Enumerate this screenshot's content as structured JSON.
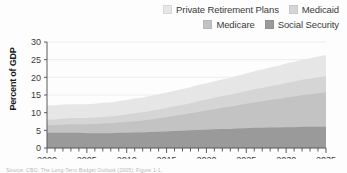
{
  "chart_data": {
    "type": "area",
    "stacked": true,
    "title": "",
    "subtitle": "",
    "xlabel": "",
    "ylabel": "Percent of GDP",
    "xlim": [
      2000,
      2035
    ],
    "ylim": [
      0,
      30
    ],
    "yticks": [
      0,
      5,
      10,
      15,
      20,
      25,
      30
    ],
    "xticks": [
      2000,
      2005,
      2010,
      2015,
      2020,
      2025,
      2030,
      2035
    ],
    "xtick_labels": [
      "2000",
      "2005",
      "2010",
      "2015",
      "2020",
      "2025",
      "2030",
      "2035"
    ],
    "ytick_labels": [
      "0",
      "5",
      "10",
      "15",
      "20",
      "25",
      "30"
    ],
    "x_minor_tick_interval": 1,
    "grid": true,
    "grid_axis": "y",
    "legend_position": "top-right",
    "x": [
      2000,
      2001,
      2002,
      2003,
      2004,
      2005,
      2006,
      2007,
      2008,
      2009,
      2010,
      2011,
      2012,
      2013,
      2014,
      2015,
      2016,
      2017,
      2018,
      2019,
      2020,
      2021,
      2022,
      2023,
      2024,
      2025,
      2026,
      2027,
      2028,
      2029,
      2030,
      2031,
      2032,
      2033,
      2034,
      2035
    ],
    "series": [
      {
        "name": "Social Security",
        "color": "#9a9a9a",
        "stack_order": 1,
        "values": [
          4.3,
          4.3,
          4.3,
          4.3,
          4.3,
          4.2,
          4.2,
          4.2,
          4.2,
          4.3,
          4.3,
          4.4,
          4.4,
          4.5,
          4.6,
          4.7,
          4.8,
          4.9,
          5.0,
          5.1,
          5.2,
          5.3,
          5.4,
          5.4,
          5.5,
          5.6,
          5.7,
          5.7,
          5.8,
          5.8,
          5.9,
          5.9,
          6.0,
          6.0,
          6.0,
          6.0
        ]
      },
      {
        "name": "Medicare",
        "color": "#c3c3c3",
        "stack_order": 2,
        "values": [
          2.2,
          2.2,
          2.3,
          2.4,
          2.4,
          2.5,
          2.6,
          2.7,
          2.8,
          2.9,
          3.1,
          3.2,
          3.4,
          3.6,
          3.8,
          4.0,
          4.3,
          4.5,
          4.8,
          5.1,
          5.4,
          5.7,
          6.0,
          6.3,
          6.6,
          6.9,
          7.2,
          7.5,
          7.8,
          8.1,
          8.4,
          8.7,
          9.0,
          9.2,
          9.5,
          9.7
        ]
      },
      {
        "name": "Medicaid",
        "color": "#d5d5d5",
        "stack_order": 3,
        "values": [
          1.5,
          1.6,
          1.7,
          1.8,
          1.8,
          1.8,
          1.8,
          1.9,
          1.9,
          2.0,
          2.1,
          2.2,
          2.3,
          2.4,
          2.5,
          2.6,
          2.7,
          2.8,
          2.9,
          3.0,
          3.1,
          3.2,
          3.3,
          3.4,
          3.5,
          3.6,
          3.7,
          3.8,
          3.9,
          4.0,
          4.1,
          4.2,
          4.3,
          4.4,
          4.5,
          4.6
        ]
      },
      {
        "name": "Private Retirement Plans",
        "color": "#e6e6e6",
        "stack_order": 4,
        "values": [
          4.0,
          4.0,
          4.0,
          3.9,
          3.9,
          3.9,
          3.9,
          4.0,
          4.0,
          4.1,
          4.1,
          4.2,
          4.2,
          4.3,
          4.3,
          4.4,
          4.4,
          4.5,
          4.5,
          4.6,
          4.6,
          4.7,
          4.7,
          4.8,
          4.9,
          5.0,
          5.1,
          5.2,
          5.3,
          5.4,
          5.5,
          5.6,
          5.7,
          5.8,
          5.9,
          6.0
        ]
      }
    ],
    "totals": [
      12.0,
      12.1,
      12.3,
      12.4,
      12.4,
      12.4,
      12.5,
      12.8,
      12.9,
      13.3,
      13.6,
      14.0,
      14.3,
      14.8,
      15.2,
      15.7,
      16.2,
      16.7,
      17.2,
      17.8,
      18.3,
      18.9,
      19.4,
      19.9,
      20.5,
      21.1,
      21.7,
      22.2,
      22.8,
      23.3,
      23.9,
      24.4,
      25.0,
      25.4,
      25.9,
      26.3
    ]
  },
  "legend": {
    "rows": [
      [
        {
          "label": "Private Retirement Plans",
          "color": "#e6e6e6"
        },
        {
          "label": "Medicaid",
          "color": "#d5d5d5"
        }
      ],
      [
        {
          "label": "Medicare",
          "color": "#c3c3c3"
        },
        {
          "label": "Social Security",
          "color": "#9a9a9a"
        }
      ]
    ]
  },
  "axes": {
    "y_axis_title": "Percent of GDP"
  },
  "source_note": {
    "text": "Source: CBO, The Long-Term Budget Outlook (2005), Figure 1-1."
  },
  "style": {
    "plot_background": "#ffffff",
    "grid_color": "#ededed",
    "axis_color": "#5a5a5a",
    "tick_label_color": "#3a3a3a"
  }
}
